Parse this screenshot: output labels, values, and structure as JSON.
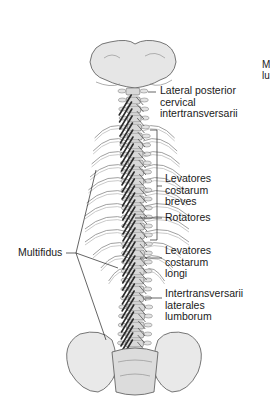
{
  "figure": {
    "labels": [
      {
        "id": "lateral-posterior-cervical-intertransversarii",
        "lines": [
          "Lateral posterior",
          "cervical",
          "intertransversarii"
        ]
      },
      {
        "id": "levatores-costarum-breves",
        "lines": [
          "Levatores",
          "costarum",
          "breves"
        ]
      },
      {
        "id": "rotatores",
        "lines": [
          "Rotatores"
        ]
      },
      {
        "id": "levatores-costarum-longi",
        "lines": [
          "Levatores",
          "costarum",
          "longi"
        ]
      },
      {
        "id": "intertransversarii-laterales-lumborum",
        "lines": [
          "Intertransversarii",
          "laterales",
          "lumborum"
        ]
      },
      {
        "id": "multifidus",
        "lines": [
          "Multifidus"
        ]
      }
    ],
    "cropped_edge_text": [
      "M",
      "lu"
    ],
    "colors": {
      "ink": "#1a1a1a",
      "bone": "#d8d8d8",
      "muscle": "#2a2a2a",
      "background": "#ffffff"
    }
  }
}
